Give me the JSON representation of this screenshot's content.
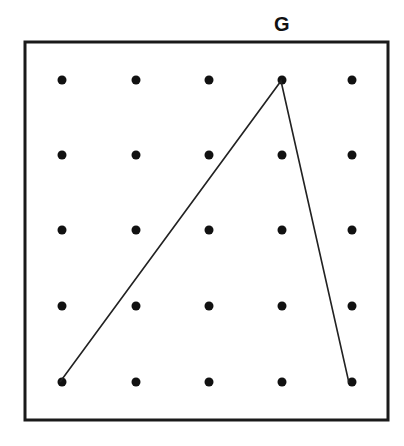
{
  "diagram": {
    "title_label": "G",
    "label_position": {
      "x": 281,
      "y": 27
    },
    "frame": {
      "x": 25,
      "y": 42,
      "width": 363,
      "height": 378,
      "stroke": "#1a1a1a",
      "stroke_width": 3
    },
    "grid": {
      "columns": [
        62,
        136,
        209,
        282,
        352
      ],
      "rows": [
        80,
        155,
        230,
        306,
        382
      ],
      "dot_radius": 4.5,
      "dot_color": "#111111"
    },
    "path": {
      "points": [
        [
          60,
          382
        ],
        [
          281,
          81
        ],
        [
          349,
          383
        ]
      ],
      "stroke": "#222222",
      "stroke_width": 1.6
    }
  }
}
